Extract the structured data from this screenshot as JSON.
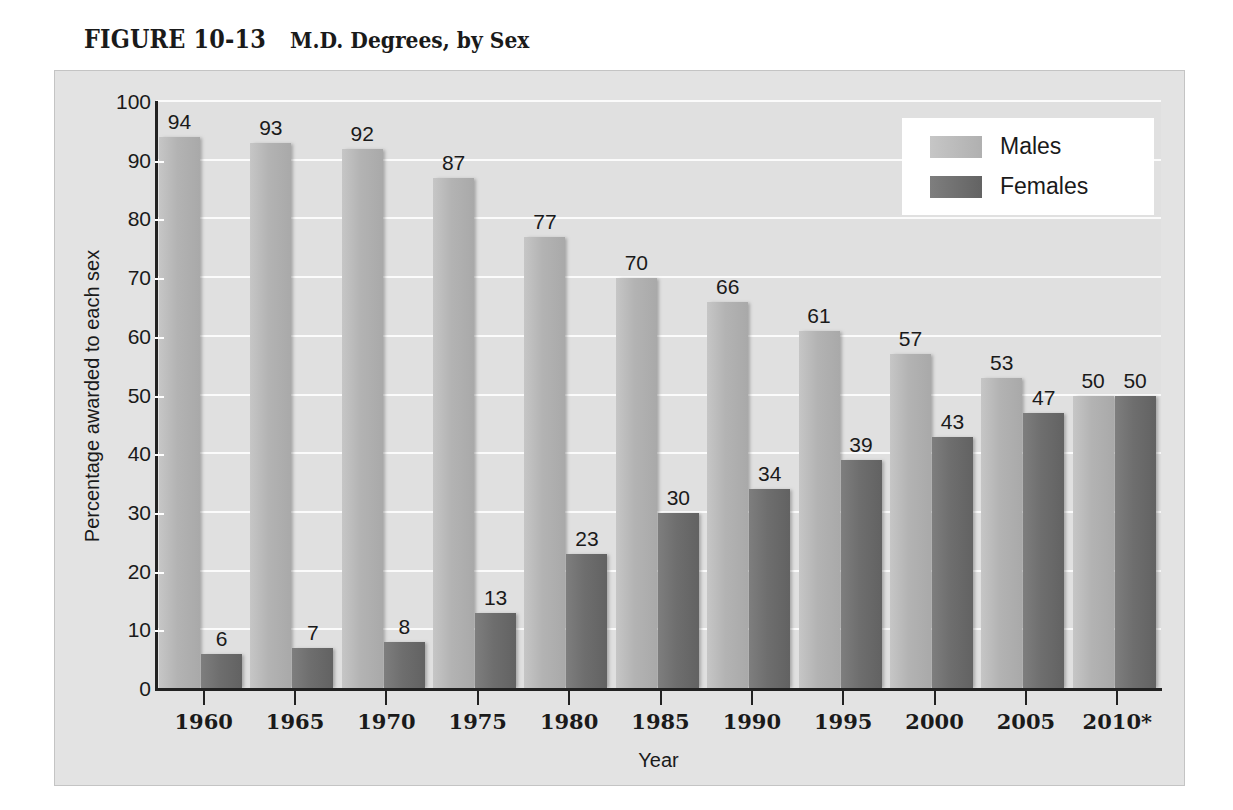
{
  "figure": {
    "number": "FIGURE 10-13",
    "name": "M.D. Degrees, by Sex"
  },
  "chart_data": {
    "type": "bar",
    "title": "M.D. Degrees, by Sex",
    "xlabel": "Year",
    "ylabel": "Percentage awarded to each sex",
    "ylim": [
      0,
      100
    ],
    "ytick_step": 10,
    "yticks": [
      0,
      10,
      20,
      30,
      40,
      50,
      60,
      70,
      80,
      90,
      100
    ],
    "grid": true,
    "legend_position": "top-right",
    "categories": [
      "1960",
      "1965",
      "1970",
      "1975",
      "1980",
      "1985",
      "1990",
      "1995",
      "2000",
      "2005",
      "2010*"
    ],
    "series": [
      {
        "name": "Males",
        "color": "#b3b3b3",
        "values": [
          94,
          93,
          92,
          87,
          77,
          70,
          66,
          61,
          57,
          53,
          50
        ]
      },
      {
        "name": "Females",
        "color": "#6e6e6e",
        "values": [
          6,
          7,
          8,
          13,
          23,
          30,
          34,
          39,
          43,
          47,
          50
        ]
      }
    ]
  },
  "legend": {
    "entries": [
      {
        "label": "Males",
        "swatch": "male-swatch"
      },
      {
        "label": "Females",
        "swatch": "female-swatch"
      }
    ]
  },
  "colors": {
    "panel_background": "#e3e3e3",
    "plot_background": "#e0e0e0",
    "gridline": "#fbfbfb",
    "axis": "#222222",
    "text": "#1a1a1a",
    "males_bar": "#b3b3b3",
    "females_bar": "#6e6e6e"
  }
}
